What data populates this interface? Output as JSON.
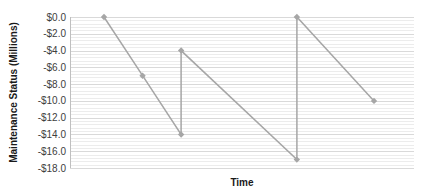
{
  "chart_data": {
    "type": "line",
    "title": "",
    "xlabel": "Time",
    "ylabel": "Maintenance Status (Millions)",
    "ylim": [
      -18,
      0
    ],
    "y_major_step": 2,
    "y_minor_step": 0.4,
    "grid": true,
    "legend": null,
    "y_tick_labels": [
      "$0.0",
      "-$2.0",
      "-$4.0",
      "-$6.0",
      "-$8.0",
      "-$10.0",
      "-$12.0",
      "-$14.0",
      "-$16.0",
      "-$18.0"
    ],
    "series": [
      {
        "name": "Maintenance Status",
        "color": "#a6a6a6",
        "marker": "diamond",
        "points": [
          {
            "x": 1,
            "y": 0
          },
          {
            "x": 2,
            "y": -7
          },
          {
            "x": 3,
            "y": -14
          },
          {
            "x": 3,
            "y": -4
          },
          {
            "x": 6,
            "y": -17
          },
          {
            "x": 6,
            "y": 0
          },
          {
            "x": 8,
            "y": -10
          }
        ]
      }
    ],
    "x_range": [
      0,
      8.6
    ]
  },
  "colors": {
    "line": "#a6a6a6",
    "marker": "#a6a6a6",
    "grid_major": "#d9d9d9",
    "grid_minor": "#ececec",
    "axis": "#bfbfbf"
  }
}
